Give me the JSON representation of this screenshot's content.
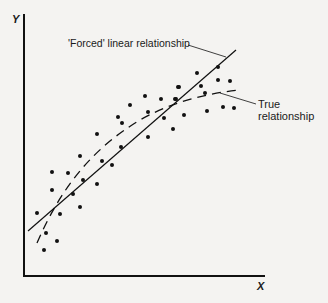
{
  "chart_data": {
    "type": "scatter",
    "title": "",
    "xlabel": "X",
    "ylabel": "Y",
    "grid": false,
    "annotations": [
      {
        "text": "'Forced' linear relationship",
        "target": "solid straight line"
      },
      {
        "text": "True relationship",
        "target": "dashed curve"
      }
    ],
    "series": [
      {
        "name": "Observations",
        "kind": "points",
        "points_px": [
          [
            44,
            250
          ],
          [
            57,
            241
          ],
          [
            46,
            233
          ],
          [
            37,
            213
          ],
          [
            60,
            214
          ],
          [
            80,
            207
          ],
          [
            52,
            190
          ],
          [
            73,
            194
          ],
          [
            52,
            172
          ],
          [
            68,
            173
          ],
          [
            83,
            180
          ],
          [
            97,
            184
          ],
          [
            80,
            156
          ],
          [
            102,
            161
          ],
          [
            112,
            165
          ],
          [
            97,
            134
          ],
          [
            121,
            147
          ],
          [
            118,
            117
          ],
          [
            122,
            123
          ],
          [
            130,
            105
          ],
          [
            145,
            96
          ],
          [
            148,
            112
          ],
          [
            148,
            137
          ],
          [
            161,
            99
          ],
          [
            164,
            118
          ],
          [
            173,
            129
          ],
          [
            176,
            99
          ],
          [
            179,
            87
          ],
          [
            175,
            99
          ],
          [
            178,
            87
          ],
          [
            184,
            115
          ],
          [
            197,
            73
          ],
          [
            201,
            86
          ],
          [
            205,
            93
          ],
          [
            207,
            111
          ],
          [
            218,
            67
          ],
          [
            218,
            80
          ],
          [
            230,
            81
          ],
          [
            223,
            107
          ],
          [
            234,
            108
          ]
        ]
      },
      {
        "name": "'Forced' linear relationship",
        "kind": "line",
        "style": "solid"
      },
      {
        "name": "True relationship",
        "kind": "curve",
        "style": "dashed"
      }
    ]
  },
  "axes": {
    "x_label": "X",
    "y_label": "Y"
  },
  "labels": {
    "forced": "'Forced' linear relationship",
    "true_line1": "True",
    "true_line2": "relationship"
  }
}
